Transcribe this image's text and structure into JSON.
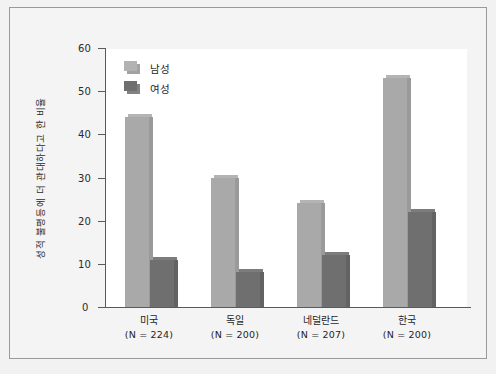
{
  "chart_data": {
    "type": "bar",
    "title": "",
    "xlabel": "",
    "ylabel": "성적 불평등에 더 관대하다고 한 비율",
    "ylim": [
      0,
      60
    ],
    "yticks": [
      0,
      10,
      20,
      30,
      40,
      50,
      60
    ],
    "grid": false,
    "legend_position": "top-left",
    "categories": [
      "미국",
      "독일",
      "네덜란드",
      "한국"
    ],
    "category_sublabels": [
      "(N = 224)",
      "(N = 200)",
      "(N = 207)",
      "(N = 200)"
    ],
    "category_n": [
      224,
      200,
      207,
      200
    ],
    "series": [
      {
        "name": "남성",
        "color": "#a9a9a9",
        "values": [
          44,
          30,
          24,
          53
        ]
      },
      {
        "name": "여성",
        "color": "#6f6f6f",
        "values": [
          11,
          8,
          12,
          22
        ]
      }
    ]
  },
  "legend": {
    "items": [
      {
        "label": "남성"
      },
      {
        "label": "여성"
      }
    ]
  },
  "colors": {
    "male_bar": "#a9a9a9",
    "female_bar": "#6f6f6f",
    "axis": "#5a5a5a",
    "panel_background": "#ffffff",
    "figure_background": "#f4f4f4",
    "frame_border": "#9a9a9a",
    "text": "#1f1f1f"
  }
}
